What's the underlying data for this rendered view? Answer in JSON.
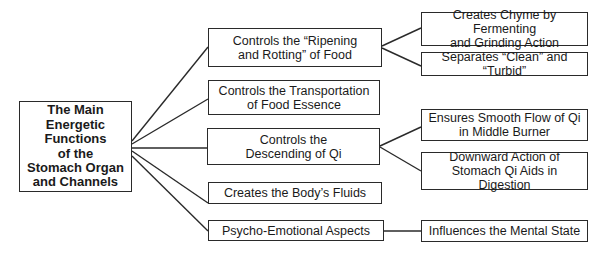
{
  "root": {
    "lines": [
      "The Main",
      "Energetic",
      "Functions",
      "of the",
      "Stomach Organ",
      "and Channels"
    ]
  },
  "functions": [
    {
      "lines": [
        "Controls the “Ripening",
        "and Rotting” of Food"
      ],
      "details": [
        {
          "lines": [
            "Creates Chyme by Fermenting",
            "and Grinding Action"
          ]
        },
        {
          "lines": [
            "Separates “Clean” and “Turbid”"
          ]
        }
      ]
    },
    {
      "lines": [
        "Controls the Transportation",
        "of Food Essence"
      ],
      "details": []
    },
    {
      "lines": [
        "Controls the",
        "Descending of Qi"
      ],
      "details": [
        {
          "lines": [
            "Ensures Smooth Flow of Qi",
            "in Middle Burner"
          ]
        },
        {
          "lines": [
            "Downward Action of",
            "Stomach Qi Aids in Digestion"
          ]
        }
      ]
    },
    {
      "lines": [
        "Creates the Body’s Fluids"
      ],
      "details": []
    },
    {
      "lines": [
        "Psycho-Emotional Aspects"
      ],
      "details": [
        {
          "lines": [
            "Influences the Mental State"
          ]
        }
      ]
    }
  ],
  "colors": {
    "line": "#2a2a2a",
    "border": "#2a2a2a",
    "background": "#ffffff"
  }
}
